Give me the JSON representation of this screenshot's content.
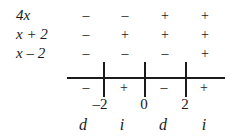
{
  "rows": [
    {
      "label": "4x",
      "signs": [
        "–",
        "–",
        "+",
        "+"
      ]
    },
    {
      "label": "x + 2",
      "signs": [
        "–",
        "+",
        "+",
        "+"
      ]
    },
    {
      "label": "x – 2",
      "signs": [
        "–",
        "–",
        "–",
        "+"
      ]
    }
  ],
  "product_signs": [
    "–",
    "+",
    "–",
    "+"
  ],
  "critical_points": [
    "–2",
    "0",
    "2"
  ],
  "behavior": [
    "d",
    "i",
    "d",
    "i"
  ]
}
